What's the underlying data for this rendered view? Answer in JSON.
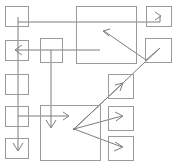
{
  "diagram": {
    "width": 178,
    "height": 168,
    "background_color": "#ffffff",
    "node_stroke_color": "#9a9a9a",
    "edge_stroke_color": "#7d7d7d",
    "node_count": 13,
    "edge_count": 9,
    "nodes": [
      {
        "id": "n1",
        "label": "",
        "name": "node-top-left",
        "x": 5,
        "y": 6,
        "w": 23,
        "h": 20
      },
      {
        "id": "n2",
        "label": "",
        "name": "node-left-2",
        "x": 5,
        "y": 40,
        "w": 23,
        "h": 20
      },
      {
        "id": "n3",
        "label": "",
        "name": "node-left-3",
        "x": 5,
        "y": 74,
        "w": 23,
        "h": 20
      },
      {
        "id": "n4",
        "label": "",
        "name": "node-left-4",
        "x": 5,
        "y": 106,
        "w": 23,
        "h": 20
      },
      {
        "id": "n5",
        "label": "",
        "name": "node-bottom-left",
        "x": 5,
        "y": 138,
        "w": 23,
        "h": 20
      },
      {
        "id": "n6",
        "label": "",
        "name": "node-middle-small",
        "x": 40,
        "y": 38,
        "w": 22,
        "h": 24
      },
      {
        "id": "n7",
        "label": "",
        "name": "node-top-center-large",
        "x": 76,
        "y": 6,
        "w": 60,
        "h": 57
      },
      {
        "id": "n8",
        "label": "",
        "name": "node-bottom-center-large",
        "x": 40,
        "y": 105,
        "w": 60,
        "h": 55
      },
      {
        "id": "n9",
        "label": "",
        "name": "node-top-right",
        "x": 146,
        "y": 6,
        "w": 25,
        "h": 20
      },
      {
        "id": "n10",
        "label": "",
        "name": "node-right-zigzag",
        "x": 145,
        "y": 38,
        "w": 26,
        "h": 24
      },
      {
        "id": "n11",
        "label": "",
        "name": "node-right-3",
        "x": 108,
        "y": 74,
        "w": 25,
        "h": 24
      },
      {
        "id": "n12",
        "label": "",
        "name": "node-right-4",
        "x": 108,
        "y": 106,
        "w": 25,
        "h": 24
      },
      {
        "id": "n13",
        "label": "",
        "name": "node-bottom-right",
        "x": 108,
        "y": 136,
        "w": 25,
        "h": 24
      }
    ],
    "edges": [
      {
        "id": "e1",
        "name": "edge-top-left-to-top-right",
        "from": "n1",
        "to": "n9",
        "points": "18,17 18,22 160,22 160,16",
        "arrow_at": "160,16",
        "arrow_dir": "right",
        "arrow_points": "155,12 161,16 155,20"
      },
      {
        "id": "e2",
        "name": "edge-vertical-left-spine",
        "from": "n1",
        "to": "n5",
        "points": "18,22 18,150",
        "arrow_at": "18,150",
        "arrow_dir": "down",
        "arrow_points": "13,143 18,151 23,143"
      },
      {
        "id": "e3",
        "name": "edge-right-to-left-horizontal",
        "from": "n7",
        "to": "n2",
        "points": "100,50 16,50",
        "arrow_at": "16,50",
        "arrow_dir": "left",
        "arrow_points": "22,45 15,50 22,55"
      },
      {
        "id": "e4",
        "name": "edge-center-small-down",
        "from": "n6",
        "to": "n8",
        "points": "51,50 51,127",
        "arrow_at": "51,127",
        "arrow_dir": "down",
        "arrow_points": "46,120 51,128 56,120"
      },
      {
        "id": "e5",
        "name": "edge-left-4-to-bottom-center",
        "from": "n4",
        "to": "n8",
        "points": "18,116 68,116",
        "arrow_at": "68,116",
        "arrow_dir": "right",
        "arrow_points": "63,112 69,116 63,120"
      },
      {
        "id": "e6",
        "name": "edge-hub-to-right-3-diagonal",
        "from": "hub",
        "to": "n11",
        "points": "74,129 122,84",
        "arrow_at": "122,84",
        "arrow_dir": "up-right",
        "arrow_points": "115,85 123,83 120,91"
      },
      {
        "id": "e7",
        "name": "edge-hub-to-right-4",
        "from": "hub",
        "to": "n12",
        "points": "74,129 122,116",
        "arrow_at": "122,116",
        "arrow_dir": "right",
        "arrow_points": "115,112 123,116 116,121"
      },
      {
        "id": "e8",
        "name": "edge-hub-to-bottom-right",
        "from": "hub",
        "to": "n13",
        "points": "74,129 122,147",
        "arrow_at": "122,147",
        "arrow_dir": "right-down",
        "arrow_points": "115,142 123,147 114,151"
      },
      {
        "id": "e9",
        "name": "edge-zigzag-to-top-center-large",
        "from": "n10",
        "to": "n7",
        "points": "74,129 160,48 146,60 104,31",
        "arrow_at": "104,31",
        "arrow_dir": "up-left",
        "arrow_points": "110,29 103,31 109,36"
      }
    ],
    "hub": {
      "name": "arrow-hub-junction",
      "x": 74,
      "y": 129,
      "r": 1.2
    }
  }
}
